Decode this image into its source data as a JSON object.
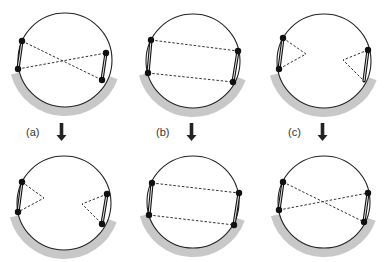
{
  "colors": {
    "circle": "#222222",
    "node": "#111111",
    "band": "#c8c8c8",
    "dash": "#333333",
    "arrow": "#222222",
    "label": "#333333"
  },
  "labels": [
    {
      "text": "(a)",
      "x": 26,
      "y": 126
    },
    {
      "text": "(b)",
      "x": 156,
      "y": 126
    },
    {
      "text": "(c)",
      "x": 288,
      "y": 126
    }
  ],
  "arrows": [
    {
      "x": 61.5,
      "y1": 123,
      "y2": 141
    },
    {
      "x": 191.5,
      "y1": 123,
      "y2": 141
    },
    {
      "x": 322.5,
      "y1": 123,
      "y2": 141
    }
  ],
  "panels": [
    {
      "id": "a-before",
      "center": [
        65,
        60
      ],
      "r": 47,
      "band": {
        "start_deg": 165,
        "end_deg": 20
      },
      "nodes": [
        [
          22,
          41
        ],
        [
          18,
          69
        ],
        [
          106,
          53
        ],
        [
          102,
          80
        ]
      ],
      "bars": [
        [
          [
            22,
            41
          ],
          [
            18,
            69
          ]
        ],
        [
          [
            106,
            53
          ],
          [
            102,
            80
          ]
        ]
      ],
      "dashes": [
        {
          "type": "line",
          "from": [
            22,
            41
          ],
          "to": [
            102,
            80
          ]
        },
        {
          "type": "line",
          "from": [
            18,
            69
          ],
          "to": [
            106,
            53
          ]
        }
      ]
    },
    {
      "id": "a-after",
      "center": [
        64,
        203
      ],
      "r": 47,
      "band": {
        "start_deg": 165,
        "end_deg": 20
      },
      "nodes": [
        [
          22,
          182
        ],
        [
          18,
          212
        ],
        [
          107,
          194
        ],
        [
          102,
          224
        ]
      ],
      "bars": [
        [
          [
            22,
            182
          ],
          [
            18,
            212
          ]
        ],
        [
          [
            107,
            194
          ],
          [
            102,
            224
          ]
        ]
      ],
      "dashes": [
        {
          "type": "curve",
          "from": [
            22,
            182
          ],
          "via": [
            44,
            198
          ],
          "to": [
            18,
            212
          ]
        },
        {
          "type": "curve",
          "from": [
            107,
            194
          ],
          "via": [
            82,
            204
          ],
          "to": [
            102,
            224
          ]
        }
      ]
    },
    {
      "id": "b-before",
      "center": [
        193,
        61
      ],
      "r": 47,
      "band": {
        "start_deg": 165,
        "end_deg": 20
      },
      "nodes": [
        [
          151,
          40
        ],
        [
          148,
          73
        ],
        [
          238,
          51
        ],
        [
          233,
          82
        ]
      ],
      "bars": [
        [
          [
            151,
            40
          ],
          [
            148,
            73
          ]
        ],
        [
          [
            238,
            51
          ],
          [
            233,
            82
          ]
        ]
      ],
      "dashes": [
        {
          "type": "line",
          "from": [
            151,
            40
          ],
          "to": [
            238,
            51
          ]
        },
        {
          "type": "line",
          "from": [
            148,
            73
          ],
          "to": [
            233,
            82
          ]
        }
      ]
    },
    {
      "id": "b-after",
      "center": [
        193,
        202
      ],
      "r": 46,
      "band": {
        "start_deg": 165,
        "end_deg": 20
      },
      "nodes": [
        [
          152,
          183
        ],
        [
          149,
          215
        ],
        [
          239,
          193
        ],
        [
          234,
          225
        ]
      ],
      "bars": [
        [
          [
            152,
            183
          ],
          [
            149,
            215
          ]
        ],
        [
          [
            239,
            193
          ],
          [
            234,
            225
          ]
        ]
      ],
      "dashes": [
        {
          "type": "line",
          "from": [
            152,
            183
          ],
          "to": [
            239,
            193
          ]
        },
        {
          "type": "line",
          "from": [
            149,
            215
          ],
          "to": [
            234,
            225
          ]
        }
      ]
    },
    {
      "id": "c-before",
      "center": [
        324,
        61
      ],
      "r": 47,
      "band": {
        "start_deg": 165,
        "end_deg": 20
      },
      "nodes": [
        [
          283,
          38
        ],
        [
          279,
          69
        ],
        [
          368,
          50
        ]
      ],
      "bars": [
        [
          [
            283,
            38
          ],
          [
            279,
            69
          ]
        ],
        [
          [
            368,
            50
          ],
          [
            364,
            81
          ]
        ]
      ],
      "dashes": [
        {
          "type": "curve",
          "from": [
            283,
            38
          ],
          "via": [
            306,
            54
          ],
          "to": [
            279,
            69
          ]
        },
        {
          "type": "curve",
          "from": [
            368,
            50
          ],
          "via": [
            343,
            60
          ],
          "to": [
            364,
            81
          ]
        }
      ]
    },
    {
      "id": "c-after",
      "center": [
        324,
        202
      ],
      "r": 46,
      "band": {
        "start_deg": 165,
        "end_deg": 20
      },
      "nodes": [
        [
          283,
          182
        ],
        [
          279,
          210
        ],
        [
          368,
          193
        ],
        [
          364,
          222
        ]
      ],
      "bars": [
        [
          [
            283,
            182
          ],
          [
            279,
            210
          ]
        ],
        [
          [
            368,
            193
          ],
          [
            364,
            222
          ]
        ]
      ],
      "dashes": [
        {
          "type": "line",
          "from": [
            283,
            182
          ],
          "to": [
            364,
            222
          ]
        },
        {
          "type": "line",
          "from": [
            279,
            210
          ],
          "to": [
            368,
            193
          ]
        }
      ]
    }
  ]
}
